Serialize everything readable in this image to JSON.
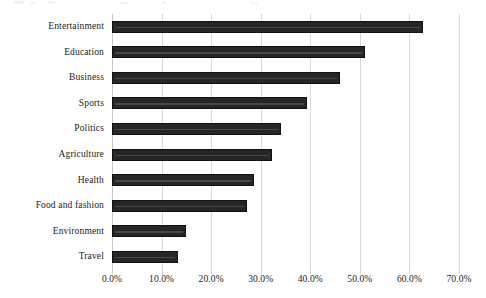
{
  "chart_data": {
    "type": "bar",
    "orientation": "horizontal",
    "title": "",
    "subtitle": "",
    "xlabel": "",
    "ylabel": "",
    "xlim": [
      0,
      70
    ],
    "grid": true,
    "legend": false,
    "legend_position": "none",
    "bar_color": "#262626",
    "gridline_color": "#d9d9d9",
    "value_suffix": "%",
    "x_ticks": [
      0,
      10,
      20,
      30,
      40,
      50,
      60,
      70
    ],
    "x_tick_labels": [
      "0.0%",
      "10.0%",
      "20.0%",
      "30.0%",
      "40.0%",
      "50.0%",
      "60.0%",
      "70.0%"
    ],
    "categories": [
      "Entertainment",
      "Education",
      "Business",
      "Sports",
      "Politics",
      "Agriculture",
      "Health",
      "Food and fashion",
      "Environment",
      "Travel"
    ],
    "values": [
      62.8,
      51.0,
      46.0,
      39.3,
      34.0,
      32.3,
      28.6,
      27.2,
      14.9,
      13.3
    ]
  }
}
